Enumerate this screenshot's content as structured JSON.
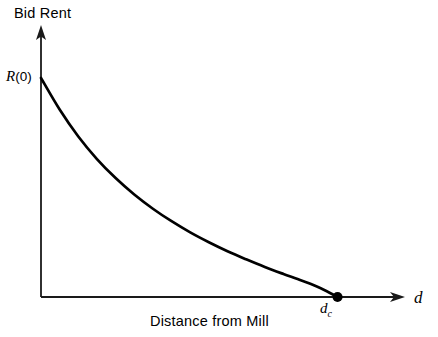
{
  "chart_data": {
    "type": "line",
    "title": "",
    "ylabel": "Bid Rent",
    "xlabel": "Distance from Mill",
    "x_axis_variable": "d",
    "grid": false,
    "legend": null,
    "xlim": [
      0,
      1.0
    ],
    "ylim": [
      0,
      1.0
    ],
    "annotations": [
      {
        "name": "y-intercept",
        "text_var": "R",
        "text_paren": "(0)",
        "x": 0,
        "y": 1.0
      },
      {
        "name": "critical-distance",
        "text_var": "d",
        "text_sub": "c",
        "x": 0.795,
        "y": 0
      }
    ],
    "series": [
      {
        "name": "bid-rent-curve",
        "color": "#000000",
        "x": [
          0.0,
          0.05,
          0.1,
          0.15,
          0.2,
          0.25,
          0.3,
          0.35,
          0.4,
          0.45,
          0.5,
          0.55,
          0.6,
          0.65,
          0.7,
          0.75,
          0.795
        ],
        "y": [
          1.0,
          0.856,
          0.733,
          0.63,
          0.543,
          0.468,
          0.403,
          0.346,
          0.295,
          0.25,
          0.209,
          0.172,
          0.137,
          0.105,
          0.074,
          0.04,
          0.0
        ]
      }
    ],
    "markers": [
      {
        "name": "critical-distance-dot",
        "x": 0.795,
        "y": 0,
        "filled": true,
        "radius": 5,
        "color": "#000000"
      }
    ],
    "axes": {
      "color": "#1a1a1a",
      "arrow_heads": [
        "y-top",
        "x-right"
      ],
      "origin_px": [
        41,
        297
      ],
      "y_top_px": 26,
      "x_right_px": 404
    }
  }
}
